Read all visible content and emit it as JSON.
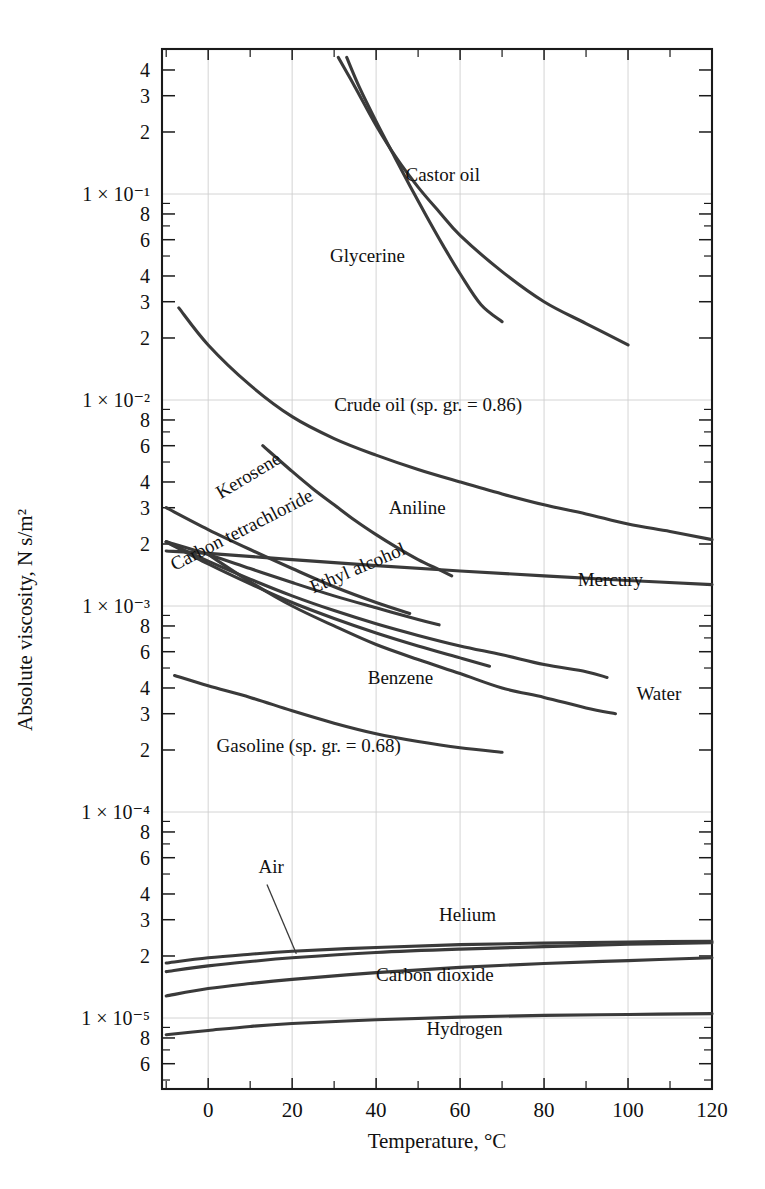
{
  "chart_data": {
    "type": "line",
    "title": "",
    "xlabel": "Temperature, °C",
    "ylabel": "Absolute viscosity, N s/m²",
    "xlim": [
      -11,
      120
    ],
    "ylim": [
      3.5e-06,
      0.55
    ],
    "yscale": "log",
    "grid": true,
    "legend_position": "inline-labels",
    "xticks": [
      0,
      20,
      40,
      60,
      80,
      100,
      120
    ],
    "xtick_labels": [
      "0",
      "20",
      "40",
      "60",
      "80",
      "100",
      "120"
    ],
    "xminor_ticks": [
      -10,
      10,
      30,
      50,
      70,
      90,
      110
    ],
    "ytick_decades": [
      "1 × 10⁻¹",
      "1 × 10⁻²",
      "1 × 10⁻³",
      "1 × 10⁻⁴",
      "1 × 10⁻⁵"
    ],
    "ytick_decade_values": [
      0.1,
      0.01,
      0.001,
      0.0001,
      1e-05
    ],
    "ytick_minor_labels": [
      "2",
      "3",
      "4",
      "6",
      "8"
    ],
    "series": [
      {
        "name": "Castor oil",
        "label": "Castor oil",
        "label_x": 47,
        "label_y": 0.115,
        "points": [
          [
            31,
            0.46
          ],
          [
            35,
            0.33
          ],
          [
            40,
            0.215
          ],
          [
            45,
            0.148
          ],
          [
            50,
            0.108
          ],
          [
            55,
            0.082
          ],
          [
            60,
            0.063
          ],
          [
            70,
            0.042
          ],
          [
            80,
            0.03
          ],
          [
            90,
            0.0235
          ],
          [
            100,
            0.0185
          ]
        ]
      },
      {
        "name": "Glycerine",
        "label": "Glycerine",
        "label_x": 29,
        "label_y": 0.047,
        "points": [
          [
            33,
            0.46
          ],
          [
            36,
            0.33
          ],
          [
            40,
            0.225
          ],
          [
            44,
            0.157
          ],
          [
            48,
            0.11
          ],
          [
            52,
            0.078
          ],
          [
            56,
            0.056
          ],
          [
            60,
            0.041
          ],
          [
            65,
            0.029
          ],
          [
            70,
            0.024
          ]
        ]
      },
      {
        "name": "Crude oil (sp. gr. = 0.86)",
        "label": "Crude oil (sp. gr. = 0.86)",
        "label_x": 30,
        "label_y": 0.0088,
        "points": [
          [
            -7,
            0.028
          ],
          [
            0,
            0.0185
          ],
          [
            10,
            0.0118
          ],
          [
            20,
            0.0083
          ],
          [
            30,
            0.0065
          ],
          [
            40,
            0.0054
          ],
          [
            50,
            0.0046
          ],
          [
            60,
            0.004
          ],
          [
            70,
            0.0035
          ],
          [
            80,
            0.0031
          ],
          [
            90,
            0.0028
          ],
          [
            100,
            0.0025
          ],
          [
            110,
            0.0023
          ],
          [
            120,
            0.0021
          ]
        ]
      },
      {
        "name": "Aniline",
        "label": "Aniline",
        "label_x": 43,
        "label_y": 0.0028,
        "points": [
          [
            13,
            0.006
          ],
          [
            20,
            0.0045
          ],
          [
            25,
            0.0037
          ],
          [
            30,
            0.0031
          ],
          [
            35,
            0.0026
          ],
          [
            40,
            0.00222
          ],
          [
            45,
            0.00192
          ],
          [
            50,
            0.00168
          ],
          [
            55,
            0.0015
          ],
          [
            58,
            0.0014
          ]
        ]
      },
      {
        "name": "Mercury",
        "label": "Mercury",
        "label_x": 88,
        "label_y": 0.00125,
        "points": [
          [
            -10,
            0.00185
          ],
          [
            0,
            0.0018
          ],
          [
            20,
            0.00168
          ],
          [
            40,
            0.00157
          ],
          [
            60,
            0.00148
          ],
          [
            80,
            0.0014
          ],
          [
            100,
            0.00133
          ],
          [
            120,
            0.00127
          ]
        ]
      },
      {
        "name": "Kerosene",
        "label": "Kerosene",
        "label_x": 3,
        "label_y": 0.0033,
        "points": [
          [
            -10,
            0.003
          ],
          [
            0,
            0.00235
          ],
          [
            10,
            0.00188
          ],
          [
            20,
            0.00152
          ],
          [
            30,
            0.00124
          ],
          [
            40,
            0.00104
          ],
          [
            48,
            0.00092
          ]
        ]
      },
      {
        "name": "Ethyl alcohol",
        "label": "Ethyl alcohol",
        "label_x": 25,
        "label_y": 0.00115,
        "points": [
          [
            -10,
            0.00205
          ],
          [
            0,
            0.00178
          ],
          [
            10,
            0.00152
          ],
          [
            20,
            0.0013
          ],
          [
            30,
            0.00112
          ],
          [
            40,
            0.00098
          ],
          [
            50,
            0.00086
          ],
          [
            55,
            0.00081
          ]
        ]
      },
      {
        "name": "Carbon tetrachloride",
        "label": "Carbon tetrachloride",
        "label_x": -8,
        "label_y": 0.00148,
        "points": [
          [
            -10,
            0.00205
          ],
          [
            0,
            0.00165
          ],
          [
            10,
            0.00135
          ],
          [
            20,
            0.00112
          ],
          [
            30,
            0.00095
          ],
          [
            40,
            0.00082
          ],
          [
            50,
            0.00072
          ],
          [
            60,
            0.00064
          ],
          [
            70,
            0.00058
          ],
          [
            80,
            0.00052
          ],
          [
            90,
            0.00048
          ],
          [
            95,
            0.00045
          ]
        ]
      },
      {
        "name": "Benzene",
        "label": "Benzene",
        "label_x": 38,
        "label_y": 0.00042,
        "points": [
          [
            -10,
            0.00205
          ],
          [
            0,
            0.0016
          ],
          [
            10,
            0.00128
          ],
          [
            20,
            0.00104
          ],
          [
            30,
            0.00087
          ],
          [
            40,
            0.00074
          ],
          [
            50,
            0.00064
          ],
          [
            60,
            0.00056
          ],
          [
            67,
            0.00051
          ]
        ]
      },
      {
        "name": "Water",
        "label": "Water",
        "label_x": 102,
        "label_y": 0.00035,
        "points": [
          [
            0,
            0.00178
          ],
          [
            10,
            0.00131
          ],
          [
            20,
            0.001
          ],
          [
            30,
            0.0008
          ],
          [
            40,
            0.00065
          ],
          [
            50,
            0.00055
          ],
          [
            60,
            0.00047
          ],
          [
            70,
            0.0004
          ],
          [
            80,
            0.00036
          ],
          [
            90,
            0.00032
          ],
          [
            97,
            0.0003
          ]
        ]
      },
      {
        "name": "Gasoline (sp. gr. = 0.68)",
        "label": "Gasoline (sp. gr. = 0.68)",
        "label_x": 2,
        "label_y": 0.000195,
        "points": [
          [
            -8,
            0.00046
          ],
          [
            0,
            0.00041
          ],
          [
            10,
            0.00036
          ],
          [
            20,
            0.00031
          ],
          [
            30,
            0.00027
          ],
          [
            40,
            0.00024
          ],
          [
            50,
            0.00022
          ],
          [
            60,
            0.000205
          ],
          [
            70,
            0.000195
          ]
        ]
      },
      {
        "name": "Helium",
        "label": "Helium",
        "label_x": 55,
        "label_y": 2.95e-05,
        "points": [
          [
            -10,
            1.85e-05
          ],
          [
            0,
            1.96e-05
          ],
          [
            10,
            2.04e-05
          ],
          [
            20,
            2.11e-05
          ],
          [
            40,
            2.2e-05
          ],
          [
            60,
            2.27e-05
          ],
          [
            80,
            2.31e-05
          ],
          [
            100,
            2.34e-05
          ],
          [
            120,
            2.36e-05
          ]
        ]
      },
      {
        "name": "Air",
        "label": "Air",
        "label_x": 12,
        "label_y": 5.05e-05,
        "points": [
          [
            -10,
            1.68e-05
          ],
          [
            0,
            1.79e-05
          ],
          [
            10,
            1.88e-05
          ],
          [
            20,
            1.96e-05
          ],
          [
            40,
            2.08e-05
          ],
          [
            60,
            2.16e-05
          ],
          [
            80,
            2.22e-05
          ],
          [
            100,
            2.28e-05
          ],
          [
            120,
            2.32e-05
          ]
        ]
      },
      {
        "name": "Carbon dioxide",
        "label": "Carbon dioxide",
        "label_x": 40,
        "label_y": 1.52e-05,
        "points": [
          [
            -10,
            1.28e-05
          ],
          [
            0,
            1.39e-05
          ],
          [
            10,
            1.47e-05
          ],
          [
            20,
            1.54e-05
          ],
          [
            40,
            1.66e-05
          ],
          [
            60,
            1.76e-05
          ],
          [
            80,
            1.84e-05
          ],
          [
            100,
            1.9e-05
          ],
          [
            120,
            1.96e-05
          ]
        ]
      },
      {
        "name": "Hydrogen",
        "label": "Hydrogen",
        "label_x": 52,
        "label_y": 8.3e-06,
        "points": [
          [
            -10,
            8.3e-06
          ],
          [
            0,
            8.7e-06
          ],
          [
            10,
            9.1e-06
          ],
          [
            20,
            9.4e-06
          ],
          [
            40,
            9.8e-06
          ],
          [
            60,
            1.01e-05
          ],
          [
            80,
            1.03e-05
          ],
          [
            100,
            1.04e-05
          ],
          [
            120,
            1.05e-05
          ]
        ]
      }
    ],
    "annotations": [
      {
        "name": "air-leader",
        "from_x": 14,
        "from_y": 4.45e-05,
        "to_x": 21,
        "to_y": 2.05e-05
      }
    ]
  },
  "axes": {
    "y_title": "Absolute viscosity, N s/m²",
    "x_title": "Temperature, °C"
  },
  "colors": {
    "curve": "#3a3a3a",
    "axis": "#1a1a1a",
    "grid": "#cfcfcf",
    "background": "#ffffff"
  }
}
